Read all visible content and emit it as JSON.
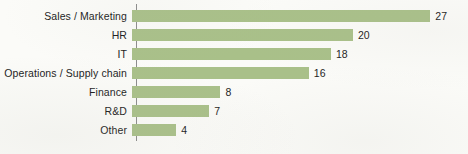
{
  "chart_data": {
    "type": "bar",
    "orientation": "horizontal",
    "title": "",
    "subtitle": "",
    "xlabel": "",
    "ylabel": "",
    "categories": [
      "Sales / Marketing",
      "HR",
      "IT",
      "Operations / Supply chain",
      "Finance",
      "R&D",
      "Other"
    ],
    "values": [
      27,
      20,
      18,
      16,
      8,
      7,
      4
    ],
    "data_labels": [
      "27",
      "20",
      "18",
      "16",
      "8",
      "7",
      "4"
    ],
    "xlim": [
      0,
      27
    ],
    "grid": false,
    "legend": false,
    "axis": {
      "category_axis_visible": true,
      "value_axis_visible": false,
      "tick_labels": []
    },
    "colors": {
      "bar_fill": "#a9c089",
      "axis_line": "#8c8c8c",
      "text": "#1c1c1c",
      "background": "#fbfbf8"
    }
  }
}
